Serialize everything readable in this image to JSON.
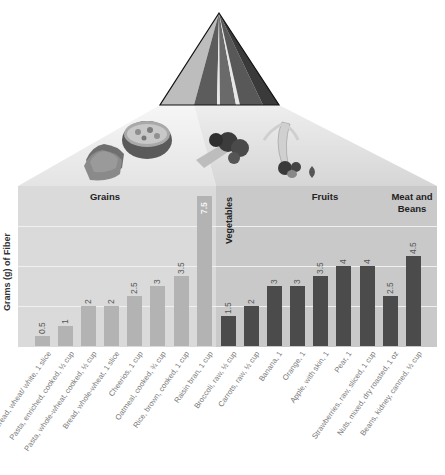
{
  "colors": {
    "grains_panel": "#dadada",
    "other_panel": "#c9c9c9",
    "grains_bar": "#b3b3b3",
    "other_bar": "#4b4b4b",
    "gridline": "#f0f0f0",
    "projection": "#ececec"
  },
  "pyramid": {
    "stripes": [
      {
        "group": "Grains",
        "color": "#bdbdbd"
      },
      {
        "group": "Vegetables",
        "color": "#5a5a5a"
      },
      {
        "group": "Fruits",
        "color": "#6e6e6e"
      },
      {
        "group": "Oils",
        "color": "#e6e6e6"
      },
      {
        "group": "Milk",
        "color": "#7a7a7a"
      },
      {
        "group": "Meat and Beans",
        "color": "#3c3c3c"
      }
    ]
  },
  "food_images": [
    {
      "name": "bread-slices"
    },
    {
      "name": "cereal-bowl"
    },
    {
      "name": "broccoli-lettuce"
    },
    {
      "name": "banana-strawberries"
    }
  ],
  "chart_data": {
    "type": "bar",
    "title": "",
    "xlabel": "",
    "ylabel": "Grams (g) of Fiber",
    "ylim": [
      0,
      8
    ],
    "grid": true,
    "gridlines_at": [
      2,
      4,
      6
    ],
    "groups": [
      {
        "name": "Grains",
        "range": [
          0,
          7
        ]
      },
      {
        "name": "Vegetables",
        "range": [
          8,
          9
        ]
      },
      {
        "name": "Fruits",
        "range": [
          10,
          14
        ]
      },
      {
        "name": "Meat and Beans",
        "range": [
          15,
          16
        ]
      }
    ],
    "categories": [
      "Bread, wheat/ white, 1 slice",
      "Pasta, enriched, cooked, ½ cup",
      "Pasta, whole-wheat, cooked, ½ cup",
      "Bread, whole-wheat, 1 slice",
      "Cheerios, 1 cup",
      "Oatmeal, cooked, ¾ cup",
      "Rice, brown, cooked, 1 cup",
      "Raisin bran, 1 cup",
      "Broccoli, raw, ½ cup",
      "Carrots, raw, ½ cup",
      "Banana, 1",
      "Orange, 1",
      "Apple, with skin, 1",
      "Pear, 1",
      "Strawberries, raw, sliced, 1 cup",
      "Nuts, mixed, dry roasted, 1 oz",
      "Beans, kidney, canned, ½ cup"
    ],
    "values": [
      0.5,
      1,
      2,
      2,
      2.5,
      3,
      3.5,
      7.5,
      1.5,
      2,
      3,
      3,
      3.5,
      4,
      4,
      2.5,
      4.5
    ],
    "value_labels": [
      "0.5",
      "1",
      "2",
      "2",
      "2.5",
      "3",
      "3.5",
      "7.5",
      "1.5",
      "2",
      "3",
      "3",
      "3.5",
      "4",
      "4",
      "2.5",
      "4.5"
    ],
    "legend": []
  },
  "labels": {
    "ylabel": "Grams (g) of Fiber",
    "grains": "Grains",
    "vegetables": "Vegetables",
    "fruits": "Fruits",
    "meat_line1": "Meat and",
    "meat_line2": "Beans"
  }
}
